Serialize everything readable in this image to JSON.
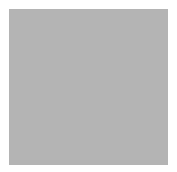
{
  "board": {
    "background": "#b4b4b4",
    "line_color": "#3a3a3a",
    "vertical_lines_x": [
      13,
      39,
      64,
      90,
      115,
      140,
      166
    ],
    "horizontal_lines_y": [
      17,
      44,
      69,
      95,
      121,
      147
    ],
    "star_points": [
      [
        39,
        44
      ],
      [
        141,
        44
      ],
      [
        39,
        147
      ],
      [
        141,
        147
      ]
    ]
  },
  "stones": [
    {
      "color": "black",
      "x": 37,
      "y": 28
    },
    {
      "color": "white",
      "x": 79,
      "y": 22
    },
    {
      "color": "black",
      "x": 95,
      "y": 42
    },
    {
      "color": "black",
      "x": 45,
      "y": 56
    },
    {
      "color": "black",
      "x": 154,
      "y": 48
    },
    {
      "color": "white",
      "x": 120,
      "y": 60
    },
    {
      "color": "black",
      "x": 146,
      "y": 72
    },
    {
      "color": "white",
      "x": 21,
      "y": 86
    },
    {
      "color": "black",
      "x": 59,
      "y": 85
    },
    {
      "color": "white",
      "x": 84,
      "y": 84
    },
    {
      "color": "black",
      "x": 116,
      "y": 91
    },
    {
      "color": "black",
      "x": 40,
      "y": 102
    },
    {
      "color": "black",
      "x": 79,
      "y": 108
    },
    {
      "color": "black",
      "x": 127,
      "y": 116
    },
    {
      "color": "black",
      "x": 152,
      "y": 117
    },
    {
      "color": "black",
      "x": 103,
      "y": 124
    },
    {
      "color": "black",
      "x": 35,
      "y": 132
    },
    {
      "color": "white",
      "x": 63,
      "y": 131
    },
    {
      "color": "black",
      "x": 95,
      "y": 151
    },
    {
      "color": "black",
      "x": 150,
      "y": 150
    }
  ]
}
